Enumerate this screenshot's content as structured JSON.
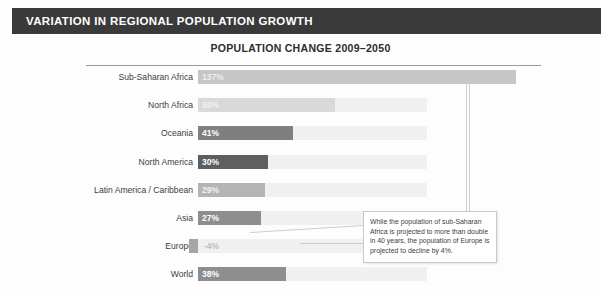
{
  "header": {
    "title": "VARIATION IN REGIONAL POPULATION GROWTH"
  },
  "chart_title": "POPULATION CHANGE 2009–2050",
  "callout": {
    "text": "While the population of sub-Saharan Africa is projected to more than double in 40 years, the population of Europe is projected to decline by 4%."
  },
  "chart_data": {
    "type": "bar",
    "orientation": "horizontal",
    "title": "POPULATION CHANGE 2009–2050",
    "xlabel": "",
    "ylabel": "",
    "categories": [
      "Sub-Saharan Africa",
      "North Africa",
      "Oceania",
      "North America",
      "Latin America / Caribbean",
      "Asia",
      "Europe",
      "World"
    ],
    "values": [
      137,
      59,
      41,
      30,
      29,
      27,
      -4,
      38
    ],
    "value_labels": [
      "137%",
      "59%",
      "41%",
      "30%",
      "29%",
      "27%",
      "-4%",
      "38%"
    ],
    "bar_colors": [
      "#c6c6c6",
      "#d9d9d9",
      "#7f7f7f",
      "#5e5e5e",
      "#b4b4b4",
      "#8e8e8e",
      "#a5a5a5",
      "#8e8e8e"
    ],
    "label_colors": [
      "#eeeeee",
      "#f1f1f1",
      "#ffffff",
      "#ffffff",
      "#f2f2f2",
      "#ffffff",
      "#bdbdbd",
      "#ffffff"
    ],
    "track_color": "#f0f0f0",
    "xlim": [
      -10,
      140
    ],
    "grid": false,
    "legend": "none"
  },
  "bottom_cut_text": ""
}
